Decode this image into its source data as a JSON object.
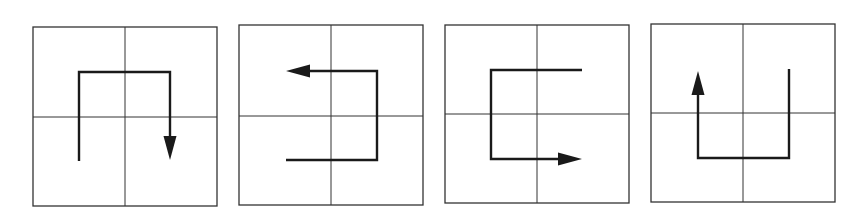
{
  "diagram": {
    "title": "",
    "background": "#ffffff",
    "stroke_color": "#1a1a1a",
    "panels": [
      {
        "id": "panel-1",
        "box": {
          "x": 33,
          "y": 27,
          "w": 184,
          "h": 179
        },
        "divider": {
          "cx": 125,
          "cy": 117
        },
        "path": [
          [
            79,
            161
          ],
          [
            79,
            72
          ],
          [
            170,
            72
          ],
          [
            170,
            146
          ]
        ],
        "arrow": {
          "tip": [
            170,
            160
          ],
          "direction": "down"
        },
        "description": "Starts bottom-left quadrant, goes up, right across top, then down with arrowhead pointing down in bottom-right quadrant"
      },
      {
        "id": "panel-2",
        "box": {
          "x": 239,
          "y": 25,
          "w": 184,
          "h": 180
        },
        "divider": {
          "cx": 331,
          "cy": 116
        },
        "path": [
          [
            286,
            160
          ],
          [
            377,
            160
          ],
          [
            377,
            71
          ],
          [
            300,
            71
          ]
        ],
        "arrow": {
          "tip": [
            286,
            71
          ],
          "direction": "left"
        },
        "description": "Starts bottom-left quadrant, goes right, up, then left with arrowhead pointing left in top-left quadrant"
      },
      {
        "id": "panel-3",
        "box": {
          "x": 445,
          "y": 25,
          "w": 184,
          "h": 178
        },
        "divider": {
          "cx": 537,
          "cy": 114
        },
        "path": [
          [
            582,
            70
          ],
          [
            491,
            70
          ],
          [
            491,
            159
          ],
          [
            568,
            159
          ]
        ],
        "arrow": {
          "tip": [
            582,
            159
          ],
          "direction": "right"
        },
        "description": "Starts top-right quadrant, goes left, down, then right with arrowhead pointing right in bottom-right quadrant"
      },
      {
        "id": "panel-4",
        "box": {
          "x": 651,
          "y": 24,
          "w": 184,
          "h": 178
        },
        "divider": {
          "cx": 743,
          "cy": 113
        },
        "path": [
          [
            789,
            69
          ],
          [
            789,
            158
          ],
          [
            698,
            158
          ],
          [
            698,
            94
          ]
        ],
        "arrow": {
          "tip": [
            698,
            71
          ],
          "direction": "up"
        },
        "description": "Starts top-right quadrant, goes down, left, then up with arrowhead pointing up in top-left quadrant"
      }
    ]
  }
}
